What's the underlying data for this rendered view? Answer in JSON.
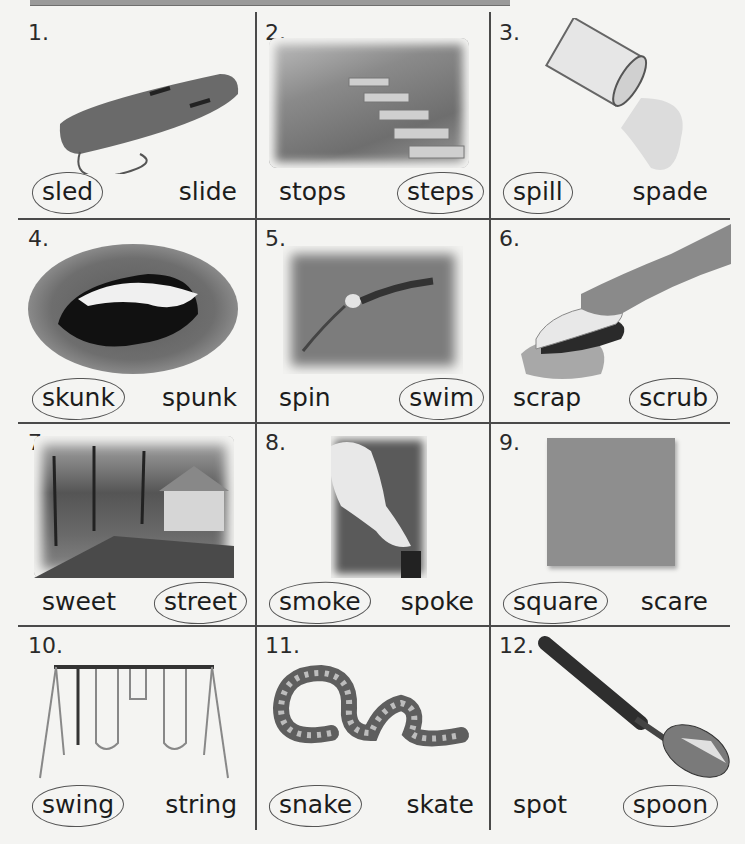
{
  "worksheet": {
    "instruction": "Circle the word that names each picture.",
    "items": [
      {
        "number": "1.",
        "picture": "sled-picture",
        "left_word": "sled",
        "right_word": "slide",
        "circled": "left"
      },
      {
        "number": "2.",
        "picture": "steps-picture",
        "left_word": "stops",
        "right_word": "steps",
        "circled": "right"
      },
      {
        "number": "3.",
        "picture": "spill-picture",
        "left_word": "spill",
        "right_word": "spade",
        "circled": "left"
      },
      {
        "number": "4.",
        "picture": "skunk-picture",
        "left_word": "skunk",
        "right_word": "spunk",
        "circled": "left"
      },
      {
        "number": "5.",
        "picture": "swim-picture",
        "left_word": "spin",
        "right_word": "swim",
        "circled": "right"
      },
      {
        "number": "6.",
        "picture": "scrub-picture",
        "left_word": "scrap",
        "right_word": "scrub",
        "circled": "right"
      },
      {
        "number": "7.",
        "picture": "street-picture",
        "left_word": "sweet",
        "right_word": "street",
        "circled": "right"
      },
      {
        "number": "8.",
        "picture": "smoke-picture",
        "left_word": "smoke",
        "right_word": "spoke",
        "circled": "left"
      },
      {
        "number": "9.",
        "picture": "square-picture",
        "left_word": "square",
        "right_word": "scare",
        "circled": "left"
      },
      {
        "number": "10.",
        "picture": "swing-picture",
        "left_word": "swing",
        "right_word": "string",
        "circled": "left"
      },
      {
        "number": "11.",
        "picture": "snake-picture",
        "left_word": "snake",
        "right_word": "skate",
        "circled": "left"
      },
      {
        "number": "12.",
        "picture": "spoon-picture",
        "left_word": "spot",
        "right_word": "spoon",
        "circled": "right"
      }
    ]
  },
  "colors": {
    "paper": "#f4f4f2",
    "grid_line": "#4a4a4a",
    "pencil": "#555555"
  }
}
